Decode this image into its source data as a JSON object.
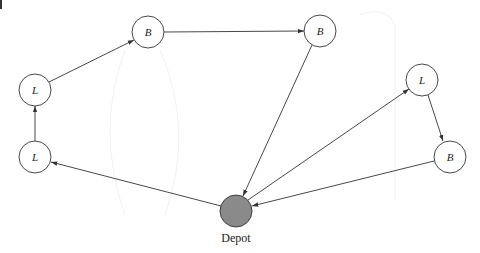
{
  "diagram": {
    "type": "vehicle-routing-graph",
    "nodes": [
      {
        "id": "L1",
        "label": "L",
        "x": 35,
        "y": 157
      },
      {
        "id": "L2",
        "label": "L",
        "x": 35,
        "y": 90
      },
      {
        "id": "B1",
        "label": "B",
        "x": 148,
        "y": 32
      },
      {
        "id": "B2",
        "label": "B",
        "x": 320,
        "y": 31
      },
      {
        "id": "L3",
        "label": "L",
        "x": 422,
        "y": 80
      },
      {
        "id": "B3",
        "label": "B",
        "x": 450,
        "y": 157
      },
      {
        "id": "depot",
        "label": "Depot",
        "x": 236,
        "y": 211
      }
    ],
    "edges": [
      {
        "from": "depot",
        "to": "L1"
      },
      {
        "from": "L1",
        "to": "L2"
      },
      {
        "from": "L2",
        "to": "B1"
      },
      {
        "from": "B1",
        "to": "B2"
      },
      {
        "from": "B2",
        "to": "depot"
      },
      {
        "from": "depot",
        "to": "L3"
      },
      {
        "from": "L3",
        "to": "B3"
      },
      {
        "from": "B3",
        "to": "depot"
      }
    ],
    "depot_label": "Depot",
    "colors": {
      "stroke": "#333333",
      "depot_fill": "#8a8a8a",
      "node_fill": "#ffffff"
    }
  }
}
